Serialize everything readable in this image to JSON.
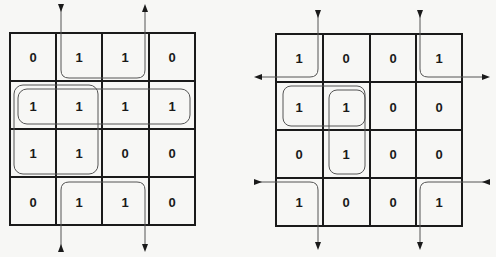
{
  "maps": [
    {
      "name": "left-kmap",
      "grid": [
        [
          "0",
          "1",
          "1",
          "0"
        ],
        [
          "1",
          "1",
          "1",
          "1"
        ],
        [
          "1",
          "1",
          "0",
          "0"
        ],
        [
          "0",
          "1",
          "1",
          "0"
        ]
      ]
    },
    {
      "name": "right-kmap",
      "grid": [
        [
          "1",
          "0",
          "0",
          "1"
        ],
        [
          "1",
          "1",
          "0",
          "0"
        ],
        [
          "0",
          "1",
          "0",
          "0"
        ],
        [
          "1",
          "0",
          "0",
          "1"
        ]
      ]
    }
  ],
  "colors": {
    "grid_line": "#1a1a1a",
    "group_line": "#555555",
    "background": "#f7f7f5"
  }
}
